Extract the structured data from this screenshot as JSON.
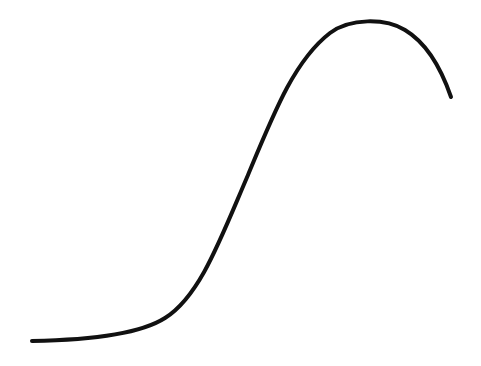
{
  "figure": {
    "background": "#ffffff",
    "stroke_color": "#111111",
    "stroke_width": 4,
    "curve_path": "M32,341 C90,340 140,334 165,318 C200,296 220,240 248,175 C275,110 295,60 330,33 C350,18 385,18 405,30 C425,42 440,65 451,97"
  }
}
